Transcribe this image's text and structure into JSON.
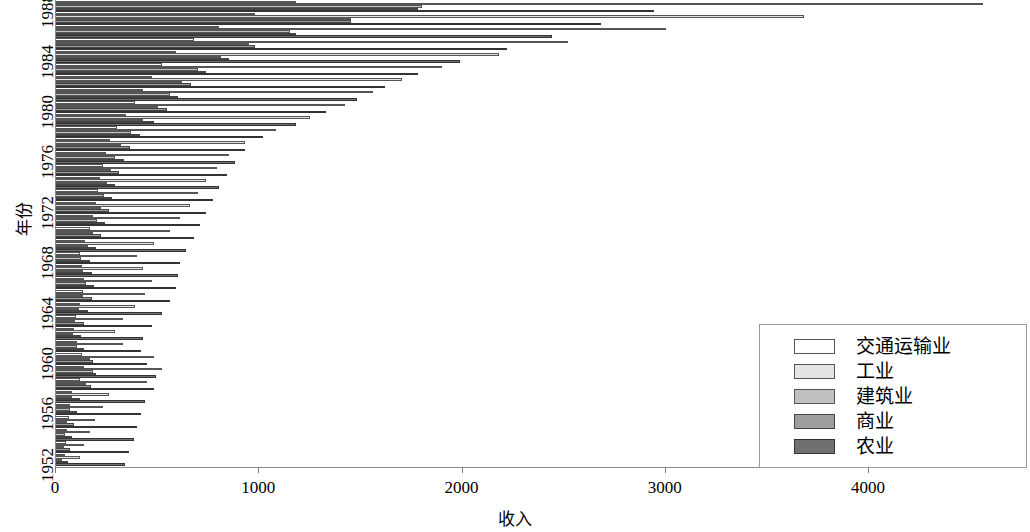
{
  "chart_data": {
    "type": "bar",
    "orientation": "horizontal",
    "grouped": true,
    "title": "",
    "xlabel": "收入",
    "ylabel": "年份",
    "xlim": [
      0,
      4800
    ],
    "grid": false,
    "legend_position": "bottom-right",
    "xticks": [
      0,
      1000,
      2000,
      3000,
      4000
    ],
    "xtick_labels": [
      "0",
      "1000",
      "2000",
      "3000",
      "4000"
    ],
    "yticks": [
      1952,
      1956,
      1960,
      1964,
      1968,
      1972,
      1976,
      1980,
      1984,
      1988
    ],
    "ytick_labels": [
      "1952",
      "1956",
      "1960",
      "1964",
      "1968",
      "1972",
      "1976",
      "1980",
      "1984",
      "1988"
    ],
    "categories": [
      1952,
      1953,
      1954,
      1955,
      1956,
      1957,
      1958,
      1959,
      1960,
      1961,
      1962,
      1963,
      1964,
      1965,
      1966,
      1967,
      1968,
      1969,
      1970,
      1971,
      1972,
      1973,
      1974,
      1975,
      1976,
      1977,
      1978,
      1979,
      1980,
      1981,
      1982,
      1983,
      1984,
      1985,
      1986,
      1987,
      1988
    ],
    "series": [
      {
        "name": "交通运输业",
        "color": "#ffffff",
        "edge": "#555555",
        "values": [
          45,
          50,
          55,
          62,
          70,
          78,
          120,
          140,
          130,
          105,
          90,
          100,
          118,
          132,
          140,
          128,
          120,
          145,
          168,
          180,
          195,
          205,
          215,
          230,
          245,
          265,
          300,
          345,
          390,
          430,
          470,
          520,
          590,
          680,
          800,
          980,
          1180
        ]
      },
      {
        "name": "工业",
        "color": "#e3e3e3",
        "edge": "#555555",
        "values": [
          120,
          140,
          165,
          190,
          230,
          260,
          450,
          520,
          480,
          330,
          290,
          330,
          390,
          440,
          470,
          430,
          400,
          480,
          560,
          610,
          660,
          700,
          740,
          790,
          850,
          930,
          1080,
          1250,
          1420,
          1560,
          1700,
          1900,
          2180,
          2520,
          3000,
          3680,
          4560
        ]
      },
      {
        "name": "建筑业",
        "color": "#c0c0c0",
        "edge": "#555555",
        "values": [
          30,
          38,
          45,
          55,
          70,
          80,
          150,
          180,
          165,
          105,
          85,
          95,
          115,
          135,
          150,
          135,
          125,
          155,
          180,
          200,
          220,
          235,
          250,
          270,
          290,
          320,
          370,
          430,
          500,
          560,
          620,
          700,
          810,
          950,
          1150,
          1450,
          1800
        ]
      },
      {
        "name": "商业",
        "color": "#9d9d9d",
        "edge": "#444444",
        "values": [
          60,
          68,
          78,
          90,
          105,
          118,
          170,
          195,
          180,
          140,
          125,
          138,
          158,
          175,
          188,
          175,
          165,
          195,
          220,
          240,
          260,
          275,
          290,
          310,
          335,
          365,
          415,
          480,
          545,
          600,
          665,
          740,
          850,
          980,
          1180,
          1450,
          1780
        ]
      },
      {
        "name": "农业",
        "color": "#707070",
        "edge": "#333333",
        "values": [
          340,
          360,
          385,
          400,
          420,
          440,
          480,
          490,
          450,
          420,
          430,
          470,
          520,
          560,
          590,
          600,
          610,
          640,
          680,
          710,
          740,
          770,
          800,
          840,
          880,
          930,
          1020,
          1180,
          1330,
          1480,
          1620,
          1780,
          1990,
          2220,
          2440,
          2680,
          2940
        ]
      }
    ]
  },
  "axes": {
    "y_axis_label": "年份",
    "x_axis_label": "收入"
  }
}
